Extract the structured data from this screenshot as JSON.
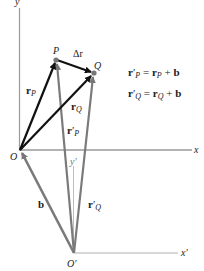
{
  "diagram": {
    "axes": {
      "y_label": "y",
      "x_label": "x",
      "x_prime_label": "x′",
      "y_prime_label": "y′",
      "origin_label": "O",
      "origin_prime_label": "O′"
    },
    "points": {
      "P": "P",
      "Q": "Q"
    },
    "vectors": {
      "delta_r": "Δr",
      "r": "r",
      "b": "b",
      "prime": "′",
      "sub_P": "P",
      "sub_Q": "Q"
    },
    "equations": [
      {
        "lhs": "r",
        "lhs_prime": "′",
        "lhs_sub": "P",
        "eq": " = ",
        "rhs": "r",
        "rhs_sub": "P",
        "plus": " + ",
        "b": "b"
      },
      {
        "lhs": "r",
        "lhs_prime": "′",
        "lhs_sub": "Q",
        "eq": " = ",
        "rhs": "r",
        "rhs_sub": "Q",
        "plus": " + ",
        "b": "b"
      }
    ],
    "colors": {
      "black_vector": "#111111",
      "gray_vector": "#7a7a7a",
      "axis": "#9a9a9a",
      "point": "#777777"
    }
  }
}
